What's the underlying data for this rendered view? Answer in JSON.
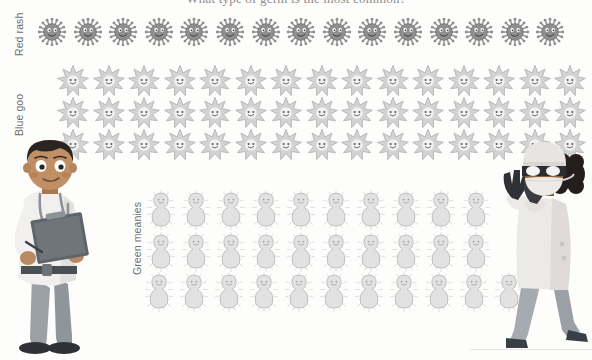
{
  "title": "What type of germ is the most common?",
  "labels": {
    "red": "Red rash",
    "blue": "Blue goo",
    "green": "Green meanies"
  },
  "colors": {
    "red_germ": "#8f8f8f",
    "blue_germ": "#d3d3d3",
    "green_germ": "#e2e2e2",
    "background": "#fdfdfc",
    "label_text": "#6f6f6f",
    "title_text": "#8e8e8e"
  },
  "characters": {
    "left": "male-doctor-with-clipboard",
    "right": "female-surgeon-waving"
  },
  "chart_data": {
    "type": "bar",
    "title": "What type of germ is the most common?",
    "xlabel": "",
    "ylabel": "",
    "categories": [
      "Red rash",
      "Blue goo",
      "Green meanies"
    ],
    "values": [
      15,
      45,
      31
    ],
    "unit": "germ icons",
    "icon_rows": {
      "red": [
        15
      ],
      "blue": [
        15,
        15,
        15
      ],
      "green": [
        10,
        10,
        11
      ]
    },
    "icons_per_full_row": {
      "red": 15,
      "blue": 15,
      "green": 11
    },
    "grid": false,
    "legend": "none",
    "ylim": [
      0,
      45
    ]
  }
}
